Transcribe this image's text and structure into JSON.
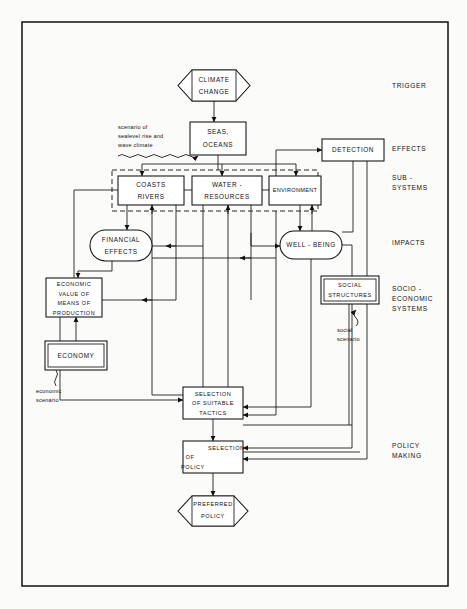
{
  "diagram": {
    "frame": {
      "x": 22,
      "y": 22,
      "width": 426,
      "height": 564
    },
    "colors": {
      "ink": "#111111",
      "paper": "#fbfbfa",
      "box_fill": "#ffffff"
    },
    "stage_labels": [
      {
        "id": "trigger",
        "text": "TRIGGER",
        "x": 392,
        "y": 86
      },
      {
        "id": "effects",
        "text": "EFFECTS",
        "x": 392,
        "y": 149
      },
      {
        "id": "subsystems_line1",
        "text": "SUB -",
        "x": 392,
        "y": 178
      },
      {
        "id": "subsystems_line2",
        "text": "SYSTEMS",
        "x": 392,
        "y": 188
      },
      {
        "id": "impacts",
        "text": "IMPACTS",
        "x": 392,
        "y": 243
      },
      {
        "id": "socio_line1",
        "text": "SOCIO -",
        "x": 392,
        "y": 289
      },
      {
        "id": "socio_line2",
        "text": "ECONOMIC",
        "x": 392,
        "y": 299
      },
      {
        "id": "socio_line3",
        "text": "SYSTEMS",
        "x": 392,
        "y": 309
      },
      {
        "id": "policy_line1",
        "text": "POLICY",
        "x": 392,
        "y": 446
      },
      {
        "id": "policy_line2",
        "text": "MAKING",
        "x": 392,
        "y": 456
      }
    ],
    "nodes": [
      {
        "id": "climate-change",
        "shape": "hexagon",
        "x": 178,
        "y": 70,
        "width": 72,
        "height": 31,
        "lines": [
          "CLIMATE",
          "CHANGE"
        ]
      },
      {
        "id": "seas-oceans",
        "shape": "rect",
        "x": 190,
        "y": 122,
        "width": 56,
        "height": 33,
        "lines": [
          "SEAS,",
          "OCEANS"
        ]
      },
      {
        "id": "detection",
        "shape": "rect",
        "x": 322,
        "y": 139,
        "width": 62,
        "height": 22,
        "lines": [
          "DETECTION"
        ]
      },
      {
        "id": "coasts-rivers",
        "shape": "rect",
        "x": 118,
        "y": 176,
        "width": 66,
        "height": 29,
        "lines": [
          "COASTS",
          "RIVERS"
        ]
      },
      {
        "id": "water-resources",
        "shape": "rect",
        "x": 192,
        "y": 176,
        "width": 70,
        "height": 29,
        "lines": [
          "WATER -",
          "RESOURCES"
        ]
      },
      {
        "id": "environment",
        "shape": "rect",
        "x": 269,
        "y": 176,
        "width": 52,
        "height": 29,
        "lines": [
          "ENVIRONMENT"
        ]
      },
      {
        "id": "financial-effects",
        "shape": "rounded",
        "x": 90,
        "y": 230,
        "width": 62,
        "height": 31,
        "lines": [
          "FINANCIAL",
          "EFFECTS"
        ]
      },
      {
        "id": "well-being",
        "shape": "rounded",
        "x": 280,
        "y": 231,
        "width": 62,
        "height": 28,
        "lines": [
          "WELL - BEING"
        ]
      },
      {
        "id": "economic-value",
        "shape": "rect",
        "x": 46,
        "y": 278,
        "width": 56,
        "height": 39,
        "lines": [
          "ECONOMIC",
          "VALUE  OF",
          "MEANS  OF",
          "PRODUCTION"
        ]
      },
      {
        "id": "social-structures",
        "shape": "rect-double",
        "x": 321,
        "y": 276,
        "width": 58,
        "height": 28,
        "lines": [
          "SOCIAL",
          "STRUCTURES"
        ]
      },
      {
        "id": "economy",
        "shape": "rect-double",
        "x": 45,
        "y": 341,
        "width": 62,
        "height": 29,
        "lines": [
          "ECONOMY"
        ]
      },
      {
        "id": "selection-tactics",
        "shape": "rect",
        "x": 183,
        "y": 387,
        "width": 60,
        "height": 32,
        "lines": [
          "SELECTION",
          "OF SUITABLE",
          "TACTICS"
        ]
      },
      {
        "id": "selection-policy",
        "shape": "rect",
        "x": 183,
        "y": 441,
        "width": 60,
        "height": 32,
        "lines": [
          "SELECTION",
          "OF",
          "POLICY"
        ]
      },
      {
        "id": "preferred-policy",
        "shape": "hexagon",
        "x": 178,
        "y": 496,
        "width": 70,
        "height": 30,
        "lines": [
          "PREFERRED",
          "POLICY"
        ]
      }
    ],
    "group_boxes": [
      {
        "id": "subsystems-group",
        "x": 112,
        "y": 170,
        "width": 206,
        "height": 41
      }
    ],
    "annotations": [
      {
        "id": "sealevel-scenario",
        "lines": [
          "scenario of",
          "sealevel rise and",
          "wave climate"
        ],
        "x": 118,
        "y": 128
      },
      {
        "id": "economic-scenario",
        "lines": [
          "economic",
          "scenario"
        ],
        "x": 36,
        "y": 392
      },
      {
        "id": "social-scenario",
        "lines": [
          "social",
          "scenario"
        ],
        "x": 341,
        "y": 330
      }
    ]
  }
}
